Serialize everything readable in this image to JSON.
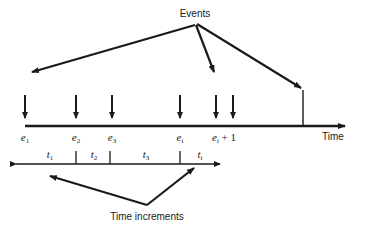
{
  "diagram": {
    "events_label": "Events",
    "time_label": "Time",
    "increments_label": "Time increments",
    "event_labels": [
      {
        "base": "e",
        "sub": "1",
        "suffix": ""
      },
      {
        "base": "e",
        "sub": "2",
        "suffix": ""
      },
      {
        "base": "e",
        "sub": "3",
        "suffix": ""
      },
      {
        "base": "e",
        "sub": "i",
        "suffix": ""
      },
      {
        "base": "e",
        "sub": "i",
        "suffix": " + 1"
      }
    ],
    "increment_labels": [
      {
        "base": "t",
        "sub": "1"
      },
      {
        "base": "t",
        "sub": "2"
      },
      {
        "base": "t",
        "sub": "3"
      },
      {
        "base": "t",
        "sub": "i"
      }
    ],
    "colors": {
      "ink": "#1a1a1a",
      "background": "#ffffff"
    }
  }
}
